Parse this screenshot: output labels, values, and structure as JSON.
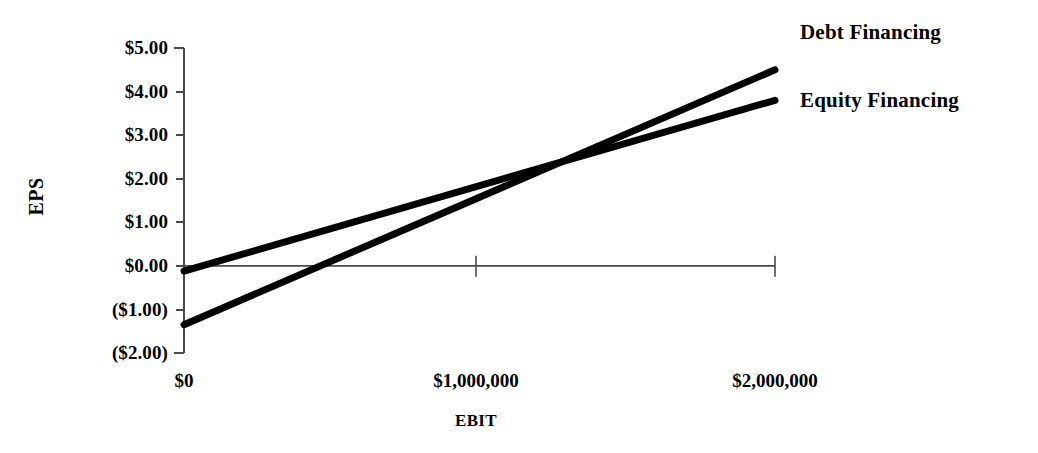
{
  "chart_data": {
    "type": "line",
    "title": "",
    "subtitle": "",
    "xlabel": "EBIT",
    "ylabel": "EPS",
    "xlim": [
      0,
      2000000
    ],
    "ylim": [
      -2.0,
      5.0
    ],
    "grid": false,
    "legend_position": "right-inline-labels",
    "x_tick_labels": [
      "$0",
      "$1,000,000",
      "$2,000,000"
    ],
    "x_tick_values": [
      0,
      1000000,
      2000000
    ],
    "y_tick_labels": [
      "$5.00",
      "$4.00",
      "$3.00",
      "$2.00",
      "$1.00",
      "$0.00",
      "($1.00)",
      "($2.00)"
    ],
    "y_tick_values": [
      5.0,
      4.0,
      3.0,
      2.0,
      1.0,
      0.0,
      -1.0,
      -2.0
    ],
    "x": [
      0,
      2000000
    ],
    "series": [
      {
        "name": "Debt Financing",
        "values": [
          -1.35,
          4.5
        ],
        "color": "#000000"
      },
      {
        "name": "Equity Financing",
        "values": [
          -0.12,
          3.8
        ],
        "color": "#000000"
      }
    ],
    "annotations": [
      {
        "name": "indifference-point",
        "x": 1350000,
        "y": 2.55,
        "label": ""
      }
    ]
  },
  "axis": {
    "y_title": "EPS",
    "x_title": "EBIT",
    "zero_line_label": "$0.00"
  },
  "legend": {
    "debt": "Debt Financing",
    "equity": "Equity Financing"
  },
  "colors": {
    "background": "#ffffff",
    "ink": "#000000",
    "axis": "#4a4a4a",
    "series_debt": "#000000",
    "series_equity": "#000000"
  }
}
